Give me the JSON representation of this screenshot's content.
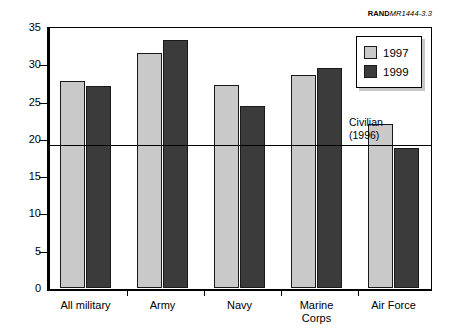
{
  "credit": {
    "organization": "RAND",
    "document": "MR1444-3.3"
  },
  "legend": {
    "entries": [
      {
        "label": "1997",
        "color": "#c9c9c9"
      },
      {
        "label": "1999",
        "color": "#3b3b3b"
      }
    ]
  },
  "annotation": {
    "line1": "Civilian",
    "line2": "(1996)"
  },
  "chart_data": {
    "type": "bar",
    "title": "",
    "xlabel": "",
    "ylabel": "",
    "ylim": [
      0,
      35
    ],
    "yticks": [
      0,
      5,
      10,
      15,
      20,
      25,
      30,
      35
    ],
    "ytick_labels": [
      "0",
      "5",
      "10",
      "15",
      "20",
      "25",
      "30",
      "35"
    ],
    "grid": false,
    "legend_position": "top-right",
    "categories": [
      "All military",
      "Army",
      "Navy",
      "Marine\nCorps",
      "Air Force"
    ],
    "series": [
      {
        "name": "1997",
        "color": "#c9c9c9",
        "values": [
          27.7,
          31.5,
          27.2,
          28.5,
          22.0
        ]
      },
      {
        "name": "1999",
        "color": "#3b3b3b",
        "values": [
          27.1,
          33.2,
          24.4,
          29.5,
          18.8
        ]
      }
    ],
    "reference_line": {
      "label": "Civilian (1996)",
      "value": 19.3
    }
  }
}
